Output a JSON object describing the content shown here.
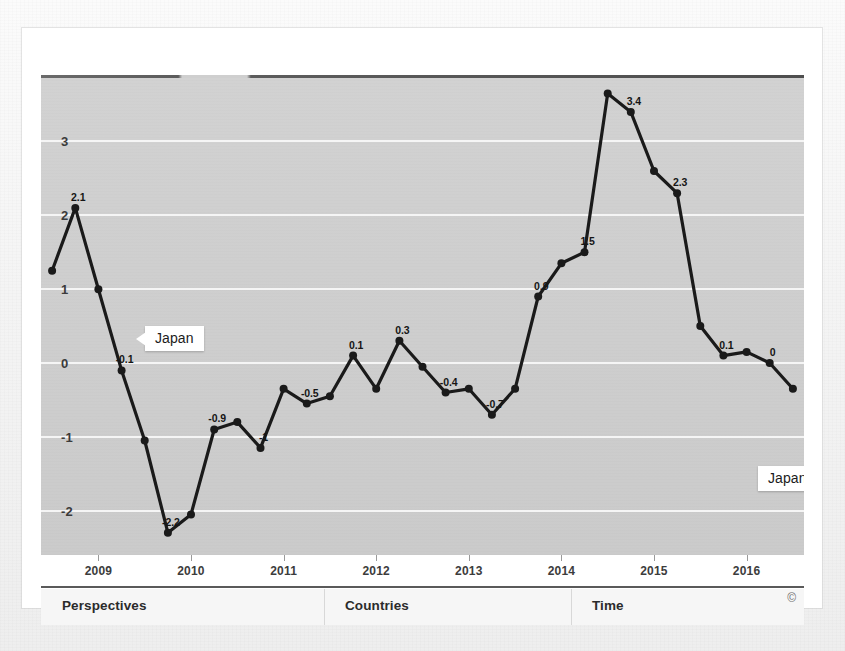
{
  "figure": {
    "background_color": "#cfcfcf",
    "series_color": "#1a1a1a",
    "gridline_color": "#f7f7f7"
  },
  "callouts": [
    {
      "label": "Japan",
      "direction": "point-left",
      "x": 104,
      "y": 251
    },
    {
      "label": "Japan",
      "direction": "point-right",
      "x": 717,
      "y": 391
    }
  ],
  "toolbar": {
    "items": [
      {
        "label": "Perspectives"
      },
      {
        "label": "Countries"
      },
      {
        "label": "Time"
      }
    ],
    "copyright": "©"
  },
  "chart_data": {
    "type": "line",
    "title": "",
    "subtitle": "",
    "xlabel": "",
    "ylabel": "",
    "series_name": "Japan",
    "grid": true,
    "legend": "none",
    "ylim": [
      -2.6,
      3.9
    ],
    "yticks": [
      3,
      2,
      1,
      0,
      -1,
      -2
    ],
    "ytick_labels": [
      "3",
      "2",
      "1",
      "0",
      "-1",
      "-2"
    ],
    "xlim": [
      2008.38,
      2016.62
    ],
    "xticks": [
      2009,
      2010,
      2011,
      2012,
      2013,
      2014,
      2015,
      2016
    ],
    "xtick_labels": [
      "2009",
      "2010",
      "2011",
      "2012",
      "2013",
      "2014",
      "2015",
      "2016"
    ],
    "x": [
      2008.5,
      2008.75,
      2009.0,
      2009.25,
      2009.5,
      2009.75,
      2010.0,
      2010.25,
      2010.5,
      2010.75,
      2011.0,
      2011.25,
      2011.5,
      2011.75,
      2012.0,
      2012.25,
      2012.5,
      2012.75,
      2013.0,
      2013.25,
      2013.5,
      2013.75,
      2014.0,
      2014.25,
      2014.5,
      2014.75,
      2015.0,
      2015.25,
      2015.5,
      2015.75,
      2016.0,
      2016.25,
      2016.5
    ],
    "values": [
      1.25,
      2.1,
      1.0,
      -0.1,
      -1.05,
      -2.3,
      -2.05,
      -0.9,
      -0.8,
      -1.15,
      -0.35,
      -0.55,
      -0.45,
      0.1,
      -0.35,
      0.3,
      -0.05,
      -0.4,
      -0.35,
      -0.7,
      -0.35,
      0.9,
      1.35,
      1.5,
      3.65,
      3.4,
      2.6,
      2.3,
      0.5,
      0.1,
      0.15,
      0.0,
      -0.35
    ],
    "point_labels": [
      {
        "index": 1,
        "text": "2.1"
      },
      {
        "index": 3,
        "text": "-0.1"
      },
      {
        "index": 5,
        "text": "-2.2"
      },
      {
        "index": 7,
        "text": "-0.9"
      },
      {
        "index": 9,
        "text": "-1"
      },
      {
        "index": 11,
        "text": "-0.5"
      },
      {
        "index": 13,
        "text": "0.1"
      },
      {
        "index": 15,
        "text": "0.3"
      },
      {
        "index": 17,
        "text": "-0.4"
      },
      {
        "index": 19,
        "text": "-0.7"
      },
      {
        "index": 21,
        "text": "0.9"
      },
      {
        "index": 23,
        "text": "1.5"
      },
      {
        "index": 25,
        "text": "3.4"
      },
      {
        "index": 27,
        "text": "2.3"
      },
      {
        "index": 29,
        "text": "0.1"
      },
      {
        "index": 31,
        "text": "0"
      }
    ]
  }
}
